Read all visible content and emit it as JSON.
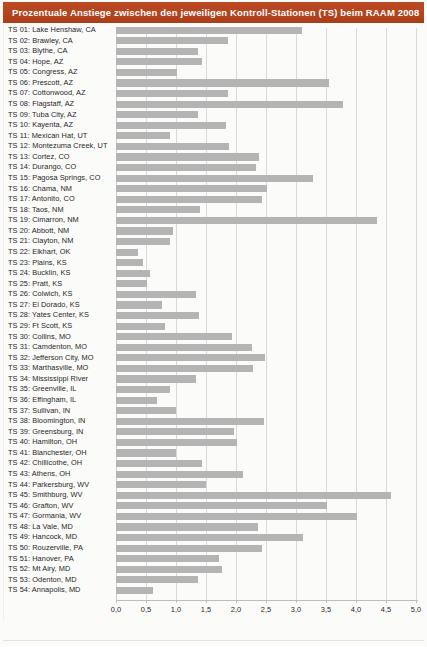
{
  "header": {
    "title": "Prozentuale Anstiege zwischen den jeweiligen Kontroll-Stationen (TS) beim RAAM 2008",
    "bar_color": "#b8441f",
    "text_color": "#ffffff"
  },
  "style": {
    "bar_color": "#b4b4b4",
    "grid_color": "#d9d9d9",
    "axis_color": "#bdbdbd",
    "page_background": "#fbfbfa"
  },
  "chart_data": {
    "type": "bar",
    "orientation": "horizontal",
    "title": "Prozentuale Anstiege zwischen den jeweiligen Kontroll-Stationen (TS) beim RAAM 2008",
    "xlabel": "",
    "ylabel": "",
    "xlim": [
      0.0,
      5.0
    ],
    "xticks": [
      0.0,
      0.5,
      1.0,
      1.5,
      2.0,
      2.5,
      3.0,
      3.5,
      4.0,
      4.5,
      5.0
    ],
    "xticklabels": [
      "0,0",
      "0,5",
      "1,0",
      "1,5",
      "2,0",
      "2,5",
      "3,0",
      "3,5",
      "4,0",
      "4,5",
      "5,0"
    ],
    "grid": true,
    "legend": false,
    "categories": [
      "TS 01: Lake Henshaw, CA",
      "TS 02: Brawley, CA",
      "TS 03: Blythe, CA",
      "TS 04: Hope, AZ",
      "TS 05: Congress, AZ",
      "TS 06: Prescott, AZ",
      "TS 07: Cottonwood, AZ",
      "TS 08: Flagstaff, AZ",
      "TS 09: Tuba City, AZ",
      "TS 10: Kayenta, AZ",
      "TS 11: Mexican Hat, UT",
      "TS 12: Montezuma Creek, UT",
      "TS 13: Cortez, CO",
      "TS 14: Durango, CO",
      "TS 15: Pagosa Springs, CO",
      "TS 16: Chama, NM",
      "TS 17: Antonito, CO",
      "TS 18: Taos, NM",
      "TS 19: Cimarron, NM",
      "TS 20: Abbott, NM",
      "TS 21: Clayton, NM",
      "TS 22: Elkhart, OK",
      "TS 23: Plains, KS",
      "TS 24: Bucklin, KS",
      "TS 25: Pratt, KS",
      "TS 26: Colwich, KS",
      "TS 27: El Dorado, KS",
      "TS 28: Yates Center, KS",
      "TS 29: Ft Scott, KS",
      "TS 30: Collins, MO",
      "TS 31: Camdenton, MO",
      "TS 32: Jefferson City, MO",
      "TS 33: Marthasville, MO",
      "TS 34: Mississippi River",
      "TS 35: Greenville, IL",
      "TS 36: Effingham, IL",
      "TS 37: Sullivan, IN",
      "TS 38: Bloomington, IN",
      "TS 39: Greensburg, IN",
      "TS 40: Hamilton, OH",
      "TS 41: Blanchester, OH",
      "TS 42: Chillicothe, OH",
      "TS 43: Athens, OH",
      "TS 44: Parkersburg, WV",
      "TS 45: Smithburg, WV",
      "TS 46: Grafton, WV",
      "TS 47: Gormania, WV",
      "TS 48: La Vale, MD",
      "TS 49: Hancock, MD",
      "TS 50: Rouzerville, PA",
      "TS 51: Hanover, PA",
      "TS 52: Mt Airy, MD",
      "TS 53: Odenton, MD",
      "TS 54: Annapolis, MD"
    ],
    "values": [
      3.1,
      1.86,
      1.36,
      1.43,
      1.01,
      3.55,
      1.87,
      3.79,
      1.36,
      1.83,
      0.9,
      1.89,
      2.38,
      2.34,
      3.29,
      2.52,
      2.43,
      1.4,
      4.35,
      0.95,
      0.9,
      0.37,
      0.45,
      0.57,
      0.51,
      1.33,
      0.77,
      1.39,
      0.81,
      1.94,
      2.26,
      2.48,
      2.28,
      1.33,
      0.9,
      0.68,
      1.0,
      2.46,
      1.97,
      2.02,
      1.0,
      1.43,
      2.12,
      1.5,
      4.58,
      3.51,
      4.02,
      2.37,
      3.11,
      2.43,
      1.71,
      1.76,
      1.36,
      0.62
    ]
  }
}
